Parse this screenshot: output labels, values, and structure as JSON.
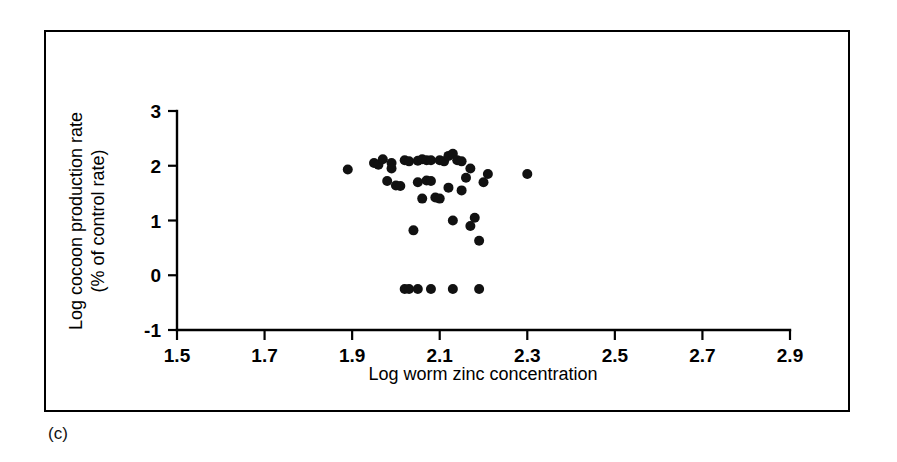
{
  "figure": {
    "panel_label": "(c)",
    "background_color": "#ffffff",
    "border_color": "#000000",
    "marker_color": "#111111"
  },
  "chart_data": {
    "type": "scatter",
    "title": "",
    "xlabel": "Log worm zinc concentration",
    "ylabel": "Log cocoon production rate\n(% of control rate)",
    "ylabel_line1": "Log cocoon production rate",
    "ylabel_line2": "(% of control rate)",
    "xlim": [
      1.5,
      2.9
    ],
    "ylim": [
      -1,
      3
    ],
    "xticks": [
      1.5,
      1.7,
      1.9,
      2.1,
      2.3,
      2.5,
      2.7,
      2.9
    ],
    "xtick_labels": [
      "1.5",
      "1.7",
      "1.9",
      "2.1",
      "2.3",
      "2.5",
      "2.7",
      "2.9"
    ],
    "yticks": [
      -1,
      0,
      1,
      2,
      3
    ],
    "ytick_labels": [
      "-1",
      "0",
      "1",
      "2",
      "3"
    ],
    "grid": false,
    "legend": false,
    "marker": "filled-circle",
    "marker_size": 9,
    "n_points": 45,
    "x": [
      1.89,
      1.95,
      1.96,
      1.97,
      1.98,
      1.99,
      1.99,
      2.0,
      2.01,
      2.02,
      2.03,
      2.04,
      2.05,
      2.05,
      2.06,
      2.06,
      2.07,
      2.07,
      2.08,
      2.08,
      2.09,
      2.1,
      2.1,
      2.11,
      2.12,
      2.12,
      2.13,
      2.13,
      2.14,
      2.15,
      2.15,
      2.16,
      2.17,
      2.17,
      2.18,
      2.19,
      2.2,
      2.21,
      2.3,
      2.02,
      2.03,
      2.05,
      2.08,
      2.13,
      2.19
    ],
    "y": [
      1.93,
      2.05,
      2.02,
      2.12,
      1.72,
      2.05,
      1.95,
      1.64,
      1.63,
      2.1,
      2.08,
      0.82,
      2.09,
      1.7,
      2.12,
      1.4,
      2.1,
      1.73,
      2.1,
      1.72,
      1.42,
      2.1,
      1.4,
      2.08,
      2.18,
      1.6,
      2.22,
      1.0,
      2.1,
      2.08,
      1.55,
      1.78,
      1.95,
      0.9,
      1.05,
      0.63,
      1.7,
      1.85,
      1.85,
      -0.25,
      -0.25,
      -0.25,
      -0.25,
      -0.25,
      -0.25
    ]
  }
}
